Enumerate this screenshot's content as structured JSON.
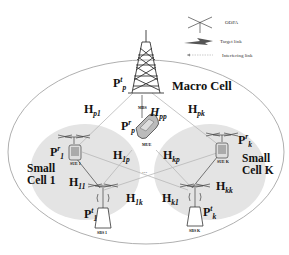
{
  "legend": {
    "items": [
      {
        "icon": "odpa-antenna-icon",
        "label": "ODPA"
      },
      {
        "icon": "target-link-icon",
        "label": "Target link"
      },
      {
        "icon": "interfering-link-icon",
        "label": "Interfering link"
      }
    ]
  },
  "regions": {
    "macro": "Macro Cell",
    "small1": [
      "Small",
      "Cell 1"
    ],
    "smallK": [
      "Small",
      "Cell K"
    ]
  },
  "nodes": {
    "mbs": "MBS",
    "mue": "MUE",
    "sue1": "SUE 1",
    "sueK": "SUE K",
    "sbs1": "SBS 1",
    "sbsK": "SBS K"
  },
  "powers": {
    "Ppt": {
      "base": "P",
      "sub": "p",
      "sup": "t"
    },
    "Ppr": {
      "base": "P",
      "sub": "p",
      "sup": "r"
    },
    "P1r": {
      "base": "P",
      "sub": "1",
      "sup": "r"
    },
    "P1t": {
      "base": "P",
      "sub": "1",
      "sup": "t"
    },
    "Pkr": {
      "base": "P",
      "sub": "k",
      "sup": "r"
    },
    "Pkt": {
      "base": "P",
      "sub": "k",
      "sup": "t"
    }
  },
  "channels": {
    "Hp1": {
      "base": "H",
      "sub": "p1"
    },
    "Hpp": {
      "base": "H",
      "sub": "pp"
    },
    "Hpk": {
      "base": "H",
      "sub": "pk"
    },
    "H1p": {
      "base": "H",
      "sub": "1p"
    },
    "H11": {
      "base": "H",
      "sub": "11"
    },
    "H1k": {
      "base": "H",
      "sub": "1k"
    },
    "Hkp": {
      "base": "H",
      "sub": "kp"
    },
    "Hkk": {
      "base": "H",
      "sub": "kk"
    },
    "Hk1": {
      "base": "H",
      "sub": "k1"
    }
  },
  "ellipsis": "..."
}
